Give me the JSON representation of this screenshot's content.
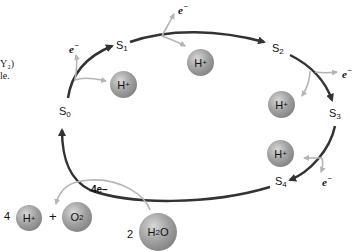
{
  "diagram": {
    "type": "Kok S-state cycle (water oxidation)",
    "cut_text": [
      "Y₂)",
      "le."
    ],
    "states": [
      {
        "id": "S0",
        "base": "S",
        "sub": "0"
      },
      {
        "id": "S1",
        "base": "S",
        "sub": "1"
      },
      {
        "id": "S2",
        "base": "S",
        "sub": "2"
      },
      {
        "id": "S3",
        "base": "S",
        "sub": "3"
      },
      {
        "id": "S4",
        "base": "S",
        "sub": "4"
      }
    ],
    "electron": {
      "base": "e",
      "sup": "−"
    },
    "proton": {
      "base": "H",
      "sup": "+"
    },
    "bottom": {
      "coef_h": "4",
      "plus": "+",
      "o2": {
        "base": "O",
        "sub": "2"
      },
      "coef_w": "2",
      "h2o": {
        "a": "H",
        "sub": "2",
        "b": "O"
      },
      "four_e": "4e−"
    },
    "colors": {
      "arrow": "#333333",
      "side_arrow": "#b5b5b5",
      "sphere": "#9a9a9a"
    }
  }
}
